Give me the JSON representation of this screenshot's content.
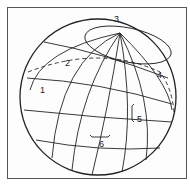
{
  "figure": {
    "type": "globe-diagram",
    "labels": [
      {
        "id": "1",
        "text": "1",
        "x": 40,
        "y": 91
      },
      {
        "id": "2",
        "text": "2",
        "x": 65,
        "y": 63
      },
      {
        "id": "3",
        "text": "3",
        "x": 114,
        "y": 13
      },
      {
        "id": "4",
        "text": "4",
        "x": 157,
        "y": 72
      },
      {
        "id": "5",
        "text": "5",
        "x": 134,
        "y": 116
      },
      {
        "id": "6",
        "text": "6",
        "x": 99,
        "y": 142
      }
    ],
    "colors": {
      "line": "#222222",
      "frame": "#555555",
      "background": "#ffffff"
    }
  }
}
